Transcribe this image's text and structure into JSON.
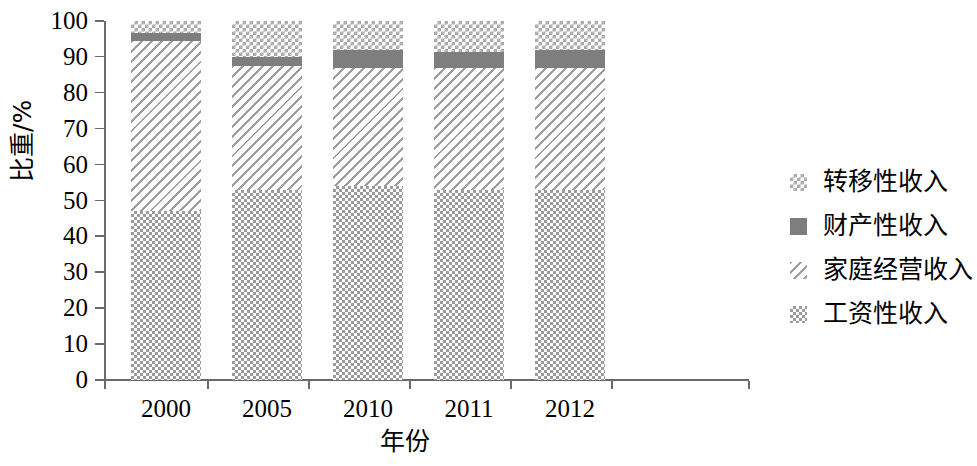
{
  "chart_data": {
    "type": "bar",
    "subtype": "stacked-100-percent",
    "title": "",
    "xlabel": "年份",
    "ylabel": "比重/%",
    "ylim": [
      0,
      100
    ],
    "yticks": [
      0,
      10,
      20,
      30,
      40,
      50,
      60,
      70,
      80,
      90,
      100
    ],
    "ytick_labels": [
      "0",
      "10",
      "20",
      "30",
      "40",
      "50",
      "60",
      "70",
      "80",
      "90",
      "100"
    ],
    "categories": [
      "2000",
      "2005",
      "2010",
      "2011",
      "2012"
    ],
    "grid": false,
    "legend_position": "right",
    "series": [
      {
        "name": "工资性收入",
        "pattern": "checker-fine",
        "color": "#9b9b9b",
        "values": [
          47,
          53,
          54,
          53,
          53
        ]
      },
      {
        "name": "家庭经营收入",
        "pattern": "diagonal-hatch",
        "color": "#9e9e9e",
        "values": [
          47.5,
          34.5,
          33,
          34,
          34
        ]
      },
      {
        "name": "财产性收入",
        "pattern": "solid",
        "color": "#7e7e7e",
        "values": [
          2.2,
          2.5,
          5,
          4.5,
          5
        ]
      },
      {
        "name": "转移性收入",
        "pattern": "checker-coarse",
        "color": "#a8a8a8",
        "values": [
          3.3,
          10,
          8,
          8.5,
          8
        ]
      }
    ]
  },
  "legend": {
    "items": [
      {
        "label": "转移性收入",
        "pattern": "checker-coarse"
      },
      {
        "label": "财产性收入",
        "pattern": "solid"
      },
      {
        "label": "家庭经营收入",
        "pattern": "diagonal-hatch"
      },
      {
        "label": "工资性收入",
        "pattern": "checker-fine"
      }
    ]
  }
}
